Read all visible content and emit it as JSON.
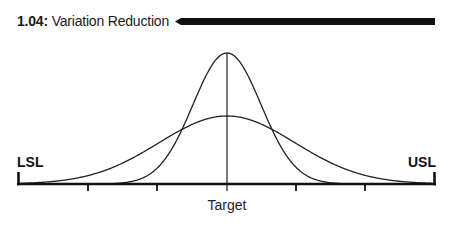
{
  "header": {
    "number": "1.04:",
    "title": "Variation Reduction"
  },
  "diagram": {
    "type": "normal-distribution-comparison",
    "labels": {
      "lower_spec_limit": "LSL",
      "upper_spec_limit": "USL",
      "center": "Target"
    },
    "curves": [
      {
        "name": "reduced-variation",
        "shape": "narrow",
        "relative_sigma": 1.0
      },
      {
        "name": "original-variation",
        "shape": "wide",
        "relative_sigma": 2.0
      }
    ],
    "axis": {
      "tick_count": 5,
      "center_tick_index": 2
    },
    "colors": {
      "ink": "#111111",
      "background": "#ffffff"
    }
  }
}
